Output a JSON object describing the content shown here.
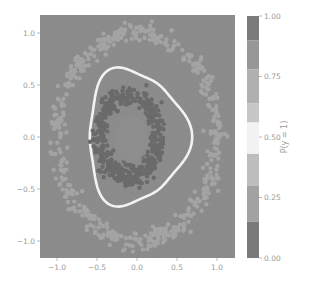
{
  "chart_data": {
    "type": "scatter",
    "title": "",
    "xlabel": "",
    "ylabel": "",
    "xlim": [
      -1.2,
      1.2
    ],
    "ylim": [
      -1.17,
      1.17
    ],
    "x_ticks": [
      -1.0,
      -0.5,
      0.0,
      0.5,
      1.0
    ],
    "x_tick_labels": [
      "−1.0",
      "−0.5",
      "0.0",
      "0.5",
      "1.0"
    ],
    "y_ticks": [
      1.0,
      0.5,
      0.0,
      -0.5,
      -1.0
    ],
    "y_tick_labels": [
      "1.0",
      "0.5",
      "0.0",
      "−0.5",
      "−1.0"
    ],
    "grid": false,
    "background": "filled contour of P(y = 1), grayscale",
    "series": [
      {
        "name": "class 0 (outer ring)",
        "shape": "annulus",
        "center": [
          0.0,
          0.0
        ],
        "radius_mean": 1.0,
        "radius_spread": 0.08,
        "color": "#a3a3a3",
        "count": 500
      },
      {
        "name": "class 1 (inner ring)",
        "shape": "annulus",
        "center": [
          -0.1,
          0.0
        ],
        "radius_mean": 0.37,
        "radius_spread": 0.08,
        "color": "#686868",
        "count": 500
      }
    ],
    "decision_boundary": {
      "level": 0.5,
      "color": "#f4f4f4",
      "shape": "rounded triangle",
      "approx_extent": {
        "xmin": -0.6,
        "xmax": 0.72,
        "ymin": -0.66,
        "ymax": 0.68
      }
    },
    "colorbar": {
      "label": "P(y = 1)",
      "ticks": [
        1.0,
        0.75,
        0.5,
        0.25,
        0.0
      ],
      "tick_labels": [
        "1.00",
        "0.75",
        "0.50",
        "0.25",
        "0.00"
      ],
      "levels": [
        {
          "from": 0.9,
          "to": 1.0,
          "color": "#7b7b7b"
        },
        {
          "from": 0.78,
          "to": 0.9,
          "color": "#979797"
        },
        {
          "from": 0.64,
          "to": 0.78,
          "color": "#b0b0b0"
        },
        {
          "from": 0.56,
          "to": 0.64,
          "color": "#c6c6c6"
        },
        {
          "from": 0.43,
          "to": 0.56,
          "color": "#f2f2f2"
        },
        {
          "from": 0.3,
          "to": 0.43,
          "color": "#bdbdbd"
        },
        {
          "from": 0.15,
          "to": 0.3,
          "color": "#a2a2a2"
        },
        {
          "from": 0.0,
          "to": 0.15,
          "color": "#7a7a7a"
        }
      ]
    }
  },
  "colors": {
    "plot_background": "#8a8a8a",
    "tick_text": "#9a9a9a",
    "boundary": "#f4f4f4"
  }
}
